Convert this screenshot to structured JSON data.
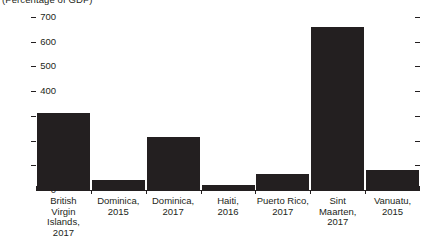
{
  "chart_data": {
    "type": "bar",
    "title": "(Percentage of GDP)",
    "xlabel": "",
    "ylabel": "",
    "ylim": [
      0,
      700
    ],
    "ytick_step": 100,
    "grid": false,
    "legend": null,
    "bar_color": "#231f20",
    "categories": [
      "British\nVirgin\nIslands,\n2017",
      "Dominica,\n2015",
      "Dominica,\n2017",
      "Haiti,\n2016",
      "Puerto Rico,\n2017",
      "Sint\nMaarten,\n2017",
      "Vanuatu,\n2015"
    ],
    "values": [
      310,
      40,
      215,
      20,
      65,
      660,
      80
    ],
    "ytick_labels": [
      "700",
      "600",
      "500",
      "400",
      "300",
      "200",
      "100",
      "0"
    ],
    "ytick_values": [
      700,
      600,
      500,
      400,
      300,
      200,
      100,
      0
    ]
  }
}
